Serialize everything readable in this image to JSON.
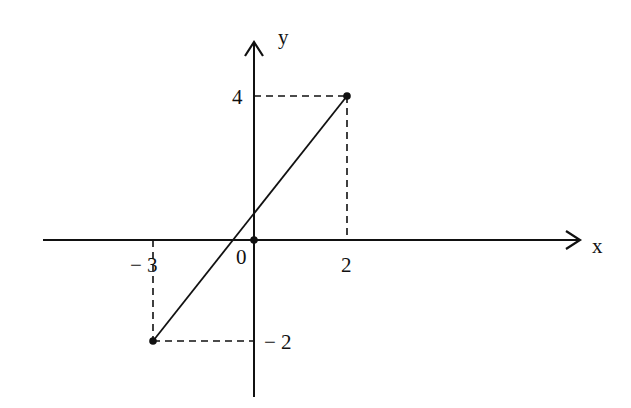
{
  "diagram": {
    "type": "coordinate-line-graph",
    "axes": {
      "x_label": "x",
      "y_label": "y",
      "origin_label": "0"
    },
    "ticks": {
      "x": [
        {
          "value": -3,
          "label": "− 3"
        },
        {
          "value": 2,
          "label": "2"
        }
      ],
      "y": [
        {
          "value": 4,
          "label": "4"
        },
        {
          "value": -2,
          "label": "− 2"
        }
      ]
    },
    "points": [
      {
        "name": "A",
        "x": -3,
        "y": -2
      },
      {
        "name": "B",
        "x": 2,
        "y": 4
      },
      {
        "name": "O",
        "x": 0,
        "y": 0
      }
    ],
    "segment": {
      "from": "A",
      "to": "B"
    },
    "guides": "dashed projections from A and B to the axes",
    "colors": {
      "ink": "#111111",
      "background": "#ffffff"
    }
  }
}
